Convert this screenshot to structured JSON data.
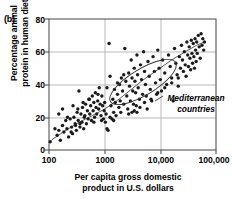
{
  "figure": {
    "panel_label": "(b)",
    "annotation_label": "Mediterranean countries",
    "annotation_line1": "Mediterranean",
    "annotation_line2": "countries"
  },
  "chart_data": {
    "type": "scatter",
    "title": "",
    "panel": "(b)",
    "xlabel": "Per capita gross domestic product in U.S. dollars",
    "xlabel_line1": "Per capita gross domestic",
    "xlabel_line2": "product in U.S. dollars",
    "ylabel": "Percentage animal protein in human diet",
    "ylabel_line1": "Percentage animal",
    "ylabel_line2": "protein in human diet",
    "xscale": "log",
    "yscale": "linear",
    "xlim": [
      100,
      100000
    ],
    "ylim": [
      0,
      80
    ],
    "xticks": [
      100,
      1000,
      10000,
      100000
    ],
    "xticklabels": [
      "100",
      "1000",
      "10,000",
      "100,000"
    ],
    "yticks": [
      0,
      20,
      40,
      60,
      80
    ],
    "yticklabels": [
      "0",
      "20",
      "40",
      "60",
      "80"
    ],
    "grid": true,
    "grid_color": "#b9b9b9",
    "legend": null,
    "marker": "filled-circle",
    "marker_color": "#1a1a1a",
    "marker_size_px": 3.4,
    "trend_line": {
      "label": "fitted trend curve",
      "color": "#4a4a4a",
      "points": [
        [
          110,
          6
        ],
        [
          200,
          12
        ],
        [
          350,
          17
        ],
        [
          600,
          21
        ],
        [
          1000,
          25
        ],
        [
          1800,
          31
        ],
        [
          3000,
          37
        ],
        [
          5000,
          43
        ],
        [
          9000,
          49
        ],
        [
          16000,
          55
        ],
        [
          28000,
          60
        ],
        [
          45000,
          64
        ],
        [
          62000,
          66
        ]
      ]
    },
    "annotations": [
      {
        "text": "Mediterranean countries",
        "style": "italic",
        "ellipse": {
          "cx_px": 143,
          "cy_px": 82,
          "rx_px": 38,
          "ry_px": 13,
          "rotation_deg": -31
        },
        "leader_line": [
          [
            163,
            96
          ],
          [
            155,
            101
          ]
        ]
      }
    ],
    "points": [
      [
        105,
        5
      ],
      [
        128,
        13
      ],
      [
        140,
        9
      ],
      [
        150,
        12
      ],
      [
        160,
        6
      ],
      [
        175,
        15
      ],
      [
        185,
        11
      ],
      [
        200,
        18
      ],
      [
        210,
        13
      ],
      [
        225,
        8
      ],
      [
        240,
        19
      ],
      [
        255,
        14
      ],
      [
        265,
        10
      ],
      [
        280,
        20
      ],
      [
        295,
        16
      ],
      [
        310,
        12
      ],
      [
        320,
        23
      ],
      [
        335,
        18
      ],
      [
        345,
        36
      ],
      [
        360,
        14
      ],
      [
        375,
        22
      ],
      [
        390,
        17
      ],
      [
        400,
        26
      ],
      [
        420,
        13
      ],
      [
        440,
        21
      ],
      [
        455,
        28
      ],
      [
        470,
        16
      ],
      [
        490,
        24
      ],
      [
        505,
        19
      ],
      [
        520,
        31
      ],
      [
        540,
        22
      ],
      [
        560,
        27
      ],
      [
        580,
        18
      ],
      [
        600,
        33
      ],
      [
        620,
        24
      ],
      [
        640,
        29
      ],
      [
        660,
        20
      ],
      [
        680,
        35
      ],
      [
        700,
        26
      ],
      [
        720,
        22
      ],
      [
        750,
        30
      ],
      [
        780,
        25
      ],
      [
        800,
        38
      ],
      [
        830,
        28
      ],
      [
        860,
        21
      ],
      [
        890,
        33
      ],
      [
        920,
        27
      ],
      [
        950,
        19
      ],
      [
        980,
        24
      ],
      [
        1000,
        29
      ],
      [
        1030,
        17
      ],
      [
        1060,
        22
      ],
      [
        1100,
        13
      ],
      [
        1150,
        12
      ],
      [
        1200,
        65
      ],
      [
        1250,
        20
      ],
      [
        1300,
        27
      ],
      [
        1350,
        19
      ],
      [
        1400,
        31
      ],
      [
        1450,
        23
      ],
      [
        1500,
        37
      ],
      [
        1550,
        29
      ],
      [
        1600,
        21
      ],
      [
        1700,
        34
      ],
      [
        1800,
        26
      ],
      [
        1850,
        40
      ],
      [
        1900,
        30
      ],
      [
        1950,
        23
      ],
      [
        2000,
        44
      ],
      [
        2100,
        36
      ],
      [
        2200,
        28
      ],
      [
        2300,
        62
      ],
      [
        2400,
        42
      ],
      [
        2500,
        33
      ],
      [
        2600,
        25
      ],
      [
        2700,
        47
      ],
      [
        2800,
        39
      ],
      [
        2900,
        30
      ],
      [
        3000,
        55
      ],
      [
        3100,
        44
      ],
      [
        3200,
        36
      ],
      [
        3300,
        28
      ],
      [
        3400,
        50
      ],
      [
        3500,
        42
      ],
      [
        3600,
        35
      ],
      [
        3700,
        27
      ],
      [
        3800,
        58
      ],
      [
        3900,
        46
      ],
      [
        4000,
        38
      ],
      [
        4200,
        31
      ],
      [
        4400,
        52
      ],
      [
        4600,
        43
      ],
      [
        4800,
        34
      ],
      [
        5000,
        60
      ],
      [
        5200,
        48
      ],
      [
        5400,
        40
      ],
      [
        5600,
        33
      ],
      [
        5800,
        25
      ],
      [
        6000,
        54
      ],
      [
        6300,
        45
      ],
      [
        6600,
        37
      ],
      [
        7000,
        30
      ],
      [
        7400,
        57
      ],
      [
        7800,
        48
      ],
      [
        8200,
        41
      ],
      [
        8600,
        34
      ],
      [
        9000,
        61
      ],
      [
        9500,
        50
      ],
      [
        10000,
        43
      ],
      [
        10500,
        36
      ],
      [
        11000,
        55
      ],
      [
        12000,
        47
      ],
      [
        13000,
        40
      ],
      [
        14000,
        58
      ],
      [
        15000,
        51
      ],
      [
        16000,
        44
      ],
      [
        17000,
        30
      ],
      [
        18000,
        62
      ],
      [
        19000,
        53
      ],
      [
        20000,
        46
      ],
      [
        21000,
        39
      ],
      [
        22000,
        57
      ],
      [
        23000,
        50
      ],
      [
        24000,
        64
      ],
      [
        25000,
        55
      ],
      [
        26000,
        48
      ],
      [
        27000,
        60
      ],
      [
        28000,
        52
      ],
      [
        29000,
        45
      ],
      [
        30000,
        66
      ],
      [
        31000,
        58
      ],
      [
        32000,
        51
      ],
      [
        33000,
        63
      ],
      [
        34000,
        56
      ],
      [
        35000,
        49
      ],
      [
        36000,
        67
      ],
      [
        37000,
        59
      ],
      [
        38000,
        53
      ],
      [
        39000,
        65
      ],
      [
        40000,
        57
      ],
      [
        41000,
        50
      ],
      [
        42000,
        68
      ],
      [
        43000,
        61
      ],
      [
        44000,
        54
      ],
      [
        45000,
        66
      ],
      [
        46000,
        59
      ],
      [
        48000,
        70
      ],
      [
        50000,
        63
      ],
      [
        52000,
        56
      ],
      [
        54000,
        71
      ],
      [
        56000,
        64
      ],
      [
        58000,
        68
      ],
      [
        60000,
        61
      ],
      [
        62000,
        66
      ],
      [
        3100,
        23
      ],
      [
        3400,
        24
      ],
      [
        3800,
        23
      ],
      [
        4300,
        26
      ],
      [
        5200,
        29
      ],
      [
        6800,
        31
      ],
      [
        9000,
        35
      ],
      [
        12000,
        38
      ],
      [
        16000,
        41
      ],
      [
        21000,
        44
      ],
      [
        2700,
        22
      ],
      [
        1450,
        18
      ],
      [
        880,
        18
      ],
      [
        640,
        17
      ],
      [
        430,
        20
      ],
      [
        330,
        25
      ],
      [
        270,
        27
      ],
      [
        215,
        20
      ],
      [
        175,
        25
      ],
      [
        150,
        22
      ],
      [
        1250,
        45
      ],
      [
        1700,
        41
      ],
      [
        2200,
        46
      ],
      [
        1100,
        38
      ],
      [
        760,
        34
      ],
      [
        530,
        31
      ],
      [
        410,
        29
      ],
      [
        360,
        16
      ],
      [
        300,
        15
      ],
      [
        250,
        11
      ]
    ]
  }
}
